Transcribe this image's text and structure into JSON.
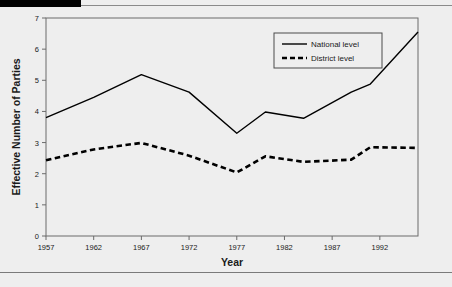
{
  "chart_data": {
    "type": "line",
    "title": "",
    "xlabel": "Year",
    "ylabel": "Effective Number of Parties",
    "xlim": [
      1957,
      1996
    ],
    "ylim": [
      0,
      7
    ],
    "xticks": [
      1957,
      1962,
      1967,
      1972,
      1977,
      1982,
      1987,
      1992
    ],
    "xtick_labels": [
      "1957",
      "1962",
      "1967",
      "1972",
      "1977",
      "1982",
      "1987",
      "1992"
    ],
    "yticks": [
      0,
      1,
      2,
      3,
      4,
      5,
      6,
      7
    ],
    "ytick_labels": [
      "0",
      "1",
      "2",
      "3",
      "4",
      "5",
      "6",
      "7"
    ],
    "grid": false,
    "legend_position": "upper right",
    "series": [
      {
        "name": "National level",
        "style": "solid",
        "color": "#000000",
        "x": [
          1957,
          1962,
          1967,
          1972,
          1977,
          1980,
          1984,
          1989,
          1991,
          1996
        ],
        "values": [
          3.8,
          4.45,
          5.18,
          4.62,
          3.3,
          3.98,
          3.78,
          4.62,
          4.88,
          6.55
        ]
      },
      {
        "name": "District level",
        "style": "dashed",
        "color": "#000000",
        "x": [
          1957,
          1962,
          1967,
          1972,
          1977,
          1980,
          1984,
          1989,
          1991,
          1996
        ],
        "values": [
          2.43,
          2.78,
          2.99,
          2.58,
          2.04,
          2.56,
          2.38,
          2.45,
          2.85,
          2.83
        ]
      }
    ]
  },
  "legend": {
    "entries": [
      {
        "label": "National level"
      },
      {
        "label": "District level"
      }
    ]
  },
  "axes": {
    "x_title": "Year",
    "y_title": "Effective Number of Parties"
  }
}
